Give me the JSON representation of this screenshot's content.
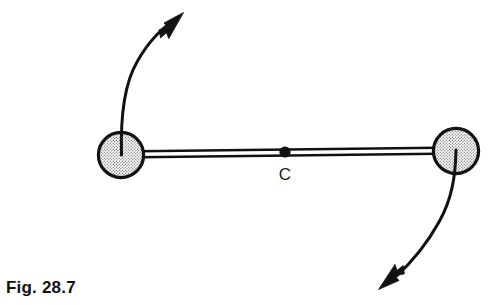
{
  "figure": {
    "caption": "Fig. 28.7",
    "center_of_mass_label": "C",
    "background_color": "#ffffff",
    "ink_color": "#111111",
    "sphere_fill_color": "#dcdcdc",
    "sphere_outline_color": "#111111"
  },
  "diagram": {
    "type": "physics-free-body-diagram",
    "rod": {
      "left_end_x": 121,
      "left_end_y": 155,
      "right_end_x": 456,
      "right_end_y": 151,
      "style": "double-line"
    },
    "spheres": [
      {
        "name": "left-sphere",
        "cx": 121,
        "cy": 155,
        "r": 24,
        "fill": "stipple"
      },
      {
        "name": "right-sphere",
        "cx": 456,
        "cy": 151,
        "r": 24,
        "fill": "stipple"
      }
    ],
    "center_of_mass": {
      "cx": 285,
      "cy": 152,
      "r": 5.5,
      "label": "C",
      "label_x": 285,
      "label_y": 180
    },
    "arrows": [
      {
        "name": "upper-left-velocity-arrow",
        "direction": "up-right",
        "start_x": 121,
        "start_y": 155,
        "tip_x": 183,
        "tip_y": 13
      },
      {
        "name": "lower-right-velocity-arrow",
        "direction": "down-left",
        "start_x": 456,
        "start_y": 150,
        "tip_x": 379,
        "tip_y": 289
      }
    ]
  }
}
